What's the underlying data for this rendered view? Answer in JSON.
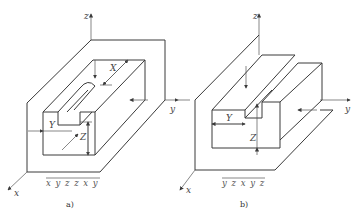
{
  "figures": [
    {
      "id": "a",
      "caption": "a)",
      "axes": {
        "x": "x",
        "y": "y",
        "z": "z"
      },
      "dimensions": {
        "X": "X",
        "Y": "Y",
        "Z": "Z"
      },
      "sequence_label": "x y z z x y",
      "feature": "closed slot (keyway) on top of block"
    },
    {
      "id": "b",
      "caption": "b)",
      "axes": {
        "x": "x",
        "y": "y",
        "z": "z"
      },
      "dimensions": {
        "Y": "Y",
        "Z": "Z"
      },
      "sequence_label": "y z x y z",
      "feature": "through step/groove along x"
    }
  ],
  "colors": {
    "line": "#3a3a3a",
    "text": "#444444",
    "background": "#ffffff"
  }
}
